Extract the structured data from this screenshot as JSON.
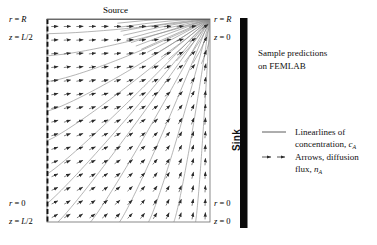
{
  "figure": {
    "source_label": "Source",
    "sink_label": "Sink",
    "corner_labels": {
      "top_left_r": "r = R",
      "top_left_z": "z = L/2",
      "top_right_r": "r = R",
      "top_right_z": "z = 0",
      "bottom_left_r": "r = 0",
      "bottom_left_z": "z = L/2",
      "bottom_right_r": "r = 0",
      "bottom_right_z": "z = 0"
    },
    "caption": {
      "line1": "Sample predictions",
      "line2": "on FEMLAB"
    },
    "legend": [
      {
        "symbol": "solid-line",
        "line1": "Linearlines of",
        "line2_prefix": "concentration, ",
        "line2_symbol": "c",
        "line2_subscript": "A"
      },
      {
        "symbol": "dashed-arrow",
        "line1": "Arrows, diffusion",
        "line2_prefix": "flux, ",
        "line2_symbol": "n",
        "line2_subscript": "A"
      }
    ],
    "colors": {
      "frame": "#6b6b6b",
      "curve": "#8d8d8d",
      "arrow": "#2b2b2b",
      "sink_bar": "#0a0a0a",
      "text": "#000000"
    }
  },
  "chart_data": {
    "type": "line",
    "title": "Sample predictions on FEMLAB",
    "xlabel": "r",
    "ylabel": "z",
    "xlim": [
      0,
      1
    ],
    "ylim": [
      0,
      1
    ],
    "grid": false,
    "legend_position": "right",
    "domain": {
      "r_left": "r = 0 (symmetry axis, left edge)",
      "r_right": "r = R (right edge, sink)",
      "z_top": "z = L/2 (top edge, source)",
      "z_bottom": "z = 0 (bottom edge)"
    },
    "singular_point": {
      "r": 1.0,
      "z": 1.0,
      "label": "r = R, z = 0"
    },
    "contour_levels": [
      0.04,
      0.1,
      0.17,
      0.25,
      0.33,
      0.42,
      0.5,
      0.58,
      0.67,
      0.75,
      0.83,
      0.9,
      0.96
    ],
    "arrow_grid": {
      "columns": 13,
      "rows": 15
    },
    "series": [
      {
        "name": "Linearlines of concentration, cA",
        "style": "solid",
        "color": "#8d8d8d"
      },
      {
        "name": "Arrows, diffusion flux, nA",
        "style": "dashed-arrow",
        "color": "#2b2b2b"
      }
    ]
  }
}
